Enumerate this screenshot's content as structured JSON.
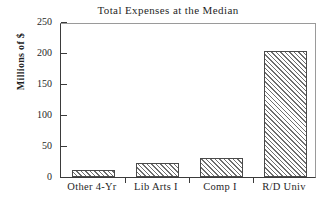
{
  "chart_data": {
    "type": "bar",
    "title": "Total Expenses at the Median",
    "xlabel": "",
    "ylabel": "Millions of $",
    "categories": [
      "Other 4-Yr",
      "Lib Arts I",
      "Comp I",
      "R/D Univ"
    ],
    "values": [
      11,
      23,
      31,
      203
    ],
    "ylim": [
      0,
      250
    ],
    "yticks": [
      0,
      50,
      100,
      150,
      200,
      250
    ],
    "ytick_labels": [
      "0",
      "50",
      "100",
      "150",
      "200",
      "250"
    ],
    "grid": false,
    "legend": null,
    "bar_fill": "diagonal-hatch",
    "colors": {
      "axis": "#3b3b3b",
      "bar_edge": "#4a4a4a",
      "hatch": "#6e6e6e",
      "background": "#ffffff",
      "text": "#1f1f1f"
    }
  }
}
